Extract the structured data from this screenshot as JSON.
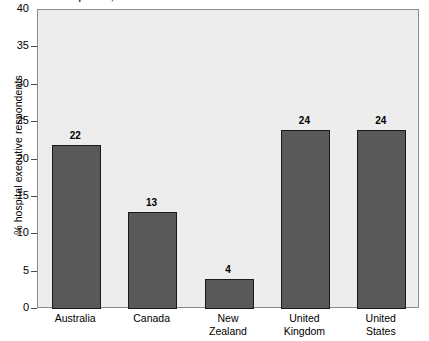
{
  "chart_data": {
    "type": "bar",
    "title": "competition, 2008",
    "title_note": "title is cropped off at the top edge of the screenshot",
    "categories": [
      "Australia",
      "Canada",
      "New Zealand",
      "United Kingdom",
      "United States"
    ],
    "category_lines": [
      [
        "Australia"
      ],
      [
        "Canada"
      ],
      [
        "New",
        "Zealand"
      ],
      [
        "United",
        "Kingdom"
      ],
      [
        "United",
        "States"
      ]
    ],
    "values": [
      22,
      13,
      4,
      24,
      24
    ],
    "value_labels": [
      "22",
      "13",
      "4",
      "24",
      "24"
    ],
    "xlabel": "",
    "ylabel": "% hospital executive respondents",
    "ylim": [
      0,
      40
    ],
    "yticks": [
      0,
      5,
      10,
      15,
      20,
      25,
      30,
      35,
      40
    ],
    "ytick_labels": [
      "0",
      "5",
      "10",
      "15",
      "20",
      "25",
      "30",
      "35",
      "40"
    ],
    "grid": false,
    "legend": null,
    "bar_color": "#595959",
    "bar_edge_color": "#1a1a1a",
    "plot_background": "#ededed",
    "axis_color": "#8c8c8c",
    "page_background": "#ffffff"
  }
}
